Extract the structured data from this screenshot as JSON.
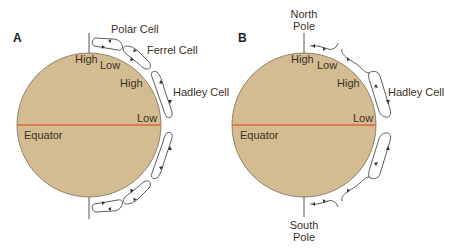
{
  "panels": [
    {
      "id": "A",
      "label": "A",
      "cells": [
        "Polar Cell",
        "Ferrel Cell",
        "Hadley Cell"
      ],
      "pressure_labels": [
        "High",
        "Low",
        "High",
        "Low"
      ],
      "equator_label": "Equator"
    },
    {
      "id": "B",
      "label": "B",
      "cells": [
        "Hadley Cell"
      ],
      "pressure_labels": [
        "High",
        "Low",
        "High",
        "Low"
      ],
      "equator_label": "Equator",
      "north_pole": [
        "North",
        "Pole"
      ],
      "south_pole": [
        "South",
        "Pole"
      ]
    }
  ],
  "colors": {
    "earth_fill": "#d4bc92",
    "earth_stroke": "#7a6a52",
    "equator_line": "#e0653a",
    "cell_stroke": "#4a4a4a"
  }
}
